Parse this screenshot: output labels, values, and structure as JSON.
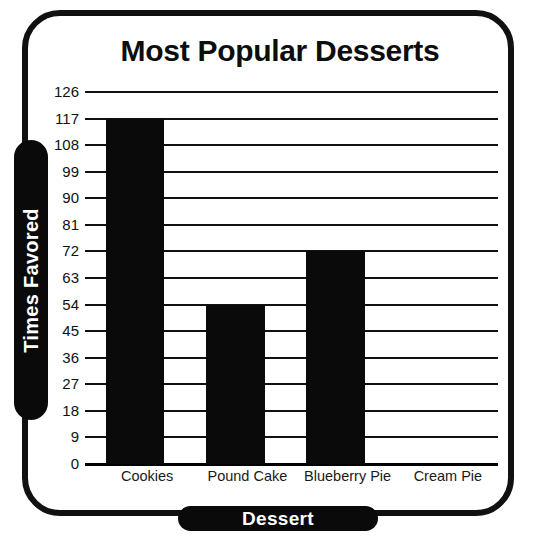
{
  "chart_data": {
    "type": "bar",
    "title": "Most Popular Desserts",
    "xlabel": "Dessert",
    "ylabel": "Times Favored",
    "categories": [
      "Cookies",
      "Pound Cake",
      "Blueberry Pie",
      "Cream Pie"
    ],
    "values": [
      117,
      54,
      72,
      0
    ],
    "ylim": [
      0,
      126
    ],
    "ytick_step": 9,
    "yticks": [
      0,
      9,
      18,
      27,
      36,
      45,
      54,
      63,
      72,
      81,
      90,
      99,
      108,
      117,
      126
    ],
    "ytick_labels": [
      "0",
      "9",
      "18",
      "27",
      "36",
      "45",
      "54",
      "63",
      "72",
      "81",
      "90",
      "99",
      "108",
      "117",
      "126"
    ],
    "grid": true,
    "grid_orientation": "horizontal",
    "legend": false,
    "bar_color": "#0a0a0a",
    "background_color": "#ffffff",
    "axis_label_color": "#ffffff",
    "axis_label_pill_color": "#0a0a0a",
    "frame_color": "#111111",
    "series": [
      {
        "name": "Times Favored",
        "values": [
          117,
          54,
          72,
          0
        ]
      }
    ],
    "points": [
      {
        "category": "Cookies",
        "value": 117
      },
      {
        "category": "Pound Cake",
        "value": 54
      },
      {
        "category": "Blueberry Pie",
        "value": 72
      },
      {
        "category": "Cream Pie",
        "value": 0
      }
    ]
  }
}
